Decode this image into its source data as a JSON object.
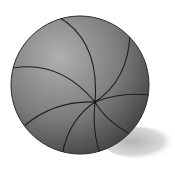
{
  "image": {
    "subject": "shaded sphere with spiral seam lines",
    "colors": {
      "background": "#ffffff",
      "sphere_light": "#a9a9a9",
      "sphere_dark": "#3a3a3a",
      "lines": "#1e1e1e",
      "shadow": "#bdbdbd"
    },
    "sphere": {
      "cx": 80,
      "cy": 85,
      "r": 69
    },
    "pole": {
      "x": 95,
      "y": 102
    },
    "shadow": {
      "cx": 140,
      "cy": 143,
      "rx": 34,
      "ry": 15
    }
  }
}
